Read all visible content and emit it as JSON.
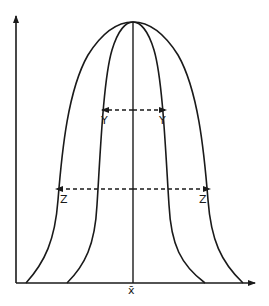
{
  "diagram": {
    "type": "distribution-curves",
    "x_axis_label": "x̄",
    "markers": {
      "inner_width": {
        "left_label": "Y",
        "right_label": "Y"
      },
      "outer_width": {
        "left_label": "Z",
        "right_label": "Z"
      }
    },
    "colors": {
      "stroke": "#1a1a1a",
      "background": "#ffffff"
    }
  }
}
